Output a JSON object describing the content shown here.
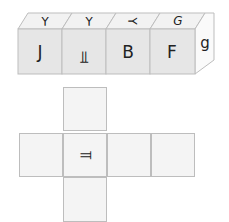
{
  "cube_strip": {
    "front_faces": [
      "J",
      "⫪",
      "B",
      "F"
    ],
    "top_faces": [
      "⅄",
      "⅄",
      "⅄",
      "G"
    ],
    "top_rotations": [
      180,
      180,
      270,
      0
    ],
    "front_rotations": [
      0,
      180,
      0,
      0
    ],
    "right_face": "g",
    "right_rotation": 0,
    "colors": {
      "front": "#e6e6e6",
      "top": "#f2f2f2",
      "side": "#fafafa",
      "edge": "#bdbdbd",
      "text": "#222222"
    }
  },
  "net": {
    "cells": [
      {
        "id": "top",
        "x": 63,
        "y": 87,
        "label": ""
      },
      {
        "id": "left",
        "x": 19,
        "y": 133,
        "label": ""
      },
      {
        "id": "center",
        "x": 63,
        "y": 133,
        "label": "⫪",
        "rotation": 90
      },
      {
        "id": "right1",
        "x": 107,
        "y": 133,
        "label": ""
      },
      {
        "id": "right2",
        "x": 151,
        "y": 133,
        "label": ""
      },
      {
        "id": "bottom",
        "x": 63,
        "y": 177,
        "label": ""
      }
    ]
  }
}
